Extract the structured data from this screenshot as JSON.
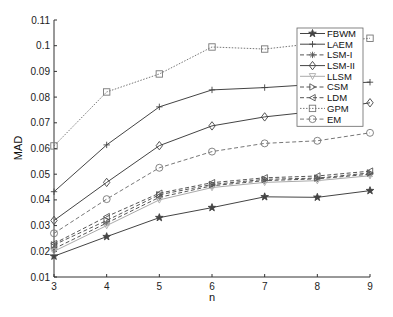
{
  "chart_data": {
    "type": "line",
    "title": "",
    "xlabel": "n",
    "ylabel": "MAD",
    "x": [
      3,
      4,
      5,
      6,
      7,
      8,
      9
    ],
    "xlim": [
      3,
      9
    ],
    "ylim": [
      0.01,
      0.11
    ],
    "xticks": [
      "3",
      "4",
      "5",
      "6",
      "7",
      "8",
      "9"
    ],
    "yticks": [
      "0.01",
      "0.02",
      "0.03",
      "0.04",
      "0.05",
      "0.06",
      "0.07",
      "0.08",
      "0.09",
      "0.1",
      "0.11"
    ],
    "grid": false,
    "legend_position": "upper right",
    "series": [
      {
        "name": "FBWM",
        "marker": "star",
        "dash": "solid",
        "color": "#444444",
        "values": [
          0.0181,
          0.0257,
          0.0331,
          0.037,
          0.0412,
          0.041,
          0.0436
        ]
      },
      {
        "name": "LAEM",
        "marker": "plus",
        "dash": "solid",
        "color": "#444444",
        "values": [
          0.0432,
          0.0614,
          0.0762,
          0.0828,
          0.0837,
          0.085,
          0.0858
        ]
      },
      {
        "name": "LSM-I",
        "marker": "asterisk",
        "dash": "dashed",
        "color": "#555555",
        "values": [
          0.021,
          0.031,
          0.041,
          0.0455,
          0.0475,
          0.0482,
          0.05
        ]
      },
      {
        "name": "LSM-II",
        "marker": "diamond",
        "dash": "solid",
        "color": "#444444",
        "values": [
          0.032,
          0.0468,
          0.0611,
          0.0688,
          0.0723,
          0.0745,
          0.0778
        ]
      },
      {
        "name": "LLSM",
        "marker": "triangle-down",
        "dash": "solid",
        "color": "#aaaaaa",
        "values": [
          0.02,
          0.03,
          0.04,
          0.0448,
          0.0468,
          0.0475,
          0.0494
        ]
      },
      {
        "name": "CSM",
        "marker": "triangle-right",
        "dash": "dashed",
        "color": "#555555",
        "values": [
          0.0225,
          0.032,
          0.042,
          0.046,
          0.048,
          0.0485,
          0.0505
        ]
      },
      {
        "name": "LDM",
        "marker": "triangle-left",
        "dash": "dashed",
        "color": "#555555",
        "values": [
          0.023,
          0.0335,
          0.0426,
          0.0467,
          0.0486,
          0.0493,
          0.0512
        ]
      },
      {
        "name": "GPM",
        "marker": "square",
        "dash": "dotted",
        "color": "#777777",
        "values": [
          0.061,
          0.082,
          0.089,
          0.0995,
          0.0987,
          0.101,
          0.1029
        ]
      },
      {
        "name": "EM",
        "marker": "circle",
        "dash": "dashed",
        "color": "#777777",
        "values": [
          0.027,
          0.0403,
          0.0525,
          0.0588,
          0.062,
          0.063,
          0.0661
        ]
      }
    ]
  }
}
